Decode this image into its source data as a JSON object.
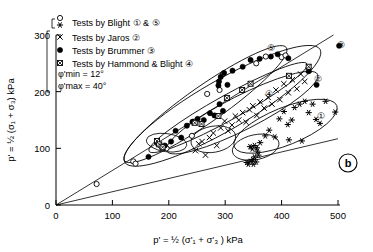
{
  "panel_label": "b",
  "axes": {
    "x": {
      "label": "p' = ½ (σ'₁ + σ'₃ ) kPa",
      "ticks": [
        "0",
        "100",
        "200",
        "300",
        "400",
        "500"
      ],
      "range": [
        0,
        500
      ]
    },
    "y": {
      "label": "p' = ½ (σ₁ + σ₃) kPa",
      "ticks": [
        "0",
        "100",
        "200",
        "300"
      ],
      "range": [
        0,
        300
      ]
    }
  },
  "legend": {
    "items": [
      {
        "marker": "circle-open-and-asterisk",
        "label": "Tests by Blight",
        "groups": "① & ⑤"
      },
      {
        "marker": "cross-x",
        "label": "Tests by Jaros",
        "groups": "②"
      },
      {
        "marker": "circle-filled",
        "label": "Tests by Brummer",
        "groups": "③"
      },
      {
        "marker": "square-hatched",
        "label": "Tests by Hammond & Blight",
        "groups": "④"
      }
    ]
  },
  "annotations": {
    "phi_min": "φ'min = 12°",
    "phi_max": "φ'max = 40°"
  },
  "group_labels": [
    {
      "text": "①",
      "x": 470,
      "y": 157
    },
    {
      "text": "②",
      "x": 465,
      "y": 222
    },
    {
      "text": "③",
      "x": 505,
      "y": 283
    },
    {
      "text": "④",
      "x": 378,
      "y": 196
    },
    {
      "text": "⑤",
      "x": 382,
      "y": 277
    }
  ],
  "chart_data": {
    "type": "scatter",
    "title": "",
    "xlabel": "p' = ½ (σ'₁ + σ'₃ ) kPa",
    "ylabel": "p' = ½ (σ₁ + σ₃) kPa",
    "xlim": [
      0,
      500
    ],
    "ylim": [
      0,
      300
    ],
    "grid": false,
    "legend_position": "top-left",
    "series": [
      {
        "name": "Tests by Blight (open circle)",
        "marker": "circle-open",
        "group": "⑤",
        "points": [
          [
            72,
            37
          ],
          [
            137,
            77
          ],
          [
            141,
            73
          ],
          [
            179,
            110
          ],
          [
            186,
            104
          ],
          [
            190,
            101
          ],
          [
            196,
            100
          ],
          [
            241,
            122
          ],
          [
            245,
            147
          ],
          [
            268,
            196
          ],
          [
            290,
            203
          ],
          [
            296,
            231
          ],
          [
            355,
            250
          ],
          [
            372,
            262
          ],
          [
            400,
            261
          ],
          [
            407,
            264
          ]
        ]
      },
      {
        "name": "Tests by Blight (asterisk)",
        "marker": "asterisk",
        "group": "①",
        "points": [
          [
            338,
            75
          ],
          [
            341,
            72
          ],
          [
            345,
            77
          ],
          [
            349,
            80
          ],
          [
            350,
            72
          ],
          [
            352,
            85
          ],
          [
            355,
            76
          ],
          [
            357,
            95
          ],
          [
            359,
            88
          ],
          [
            344,
            103
          ],
          [
            348,
            99
          ],
          [
            352,
            105
          ],
          [
            356,
            101
          ],
          [
            362,
            110
          ],
          [
            371,
            122
          ],
          [
            378,
            132
          ],
          [
            388,
            120
          ],
          [
            396,
            152
          ],
          [
            404,
            165
          ],
          [
            411,
            142
          ],
          [
            418,
            150
          ],
          [
            423,
            172
          ],
          [
            432,
            178
          ],
          [
            441,
            183
          ],
          [
            448,
            163
          ],
          [
            455,
            178
          ],
          [
            461,
            151
          ],
          [
            468,
            144
          ],
          [
            478,
            183
          ],
          [
            495,
            164
          ],
          [
            413,
            115
          ],
          [
            436,
            113
          ]
        ]
      },
      {
        "name": "Tests by Jaros",
        "marker": "cross-x",
        "group": "②",
        "points": [
          [
            247,
            96
          ],
          [
            253,
            108
          ],
          [
            259,
            112
          ],
          [
            265,
            88
          ],
          [
            272,
            119
          ],
          [
            279,
            127
          ],
          [
            285,
            105
          ],
          [
            292,
            136
          ],
          [
            299,
            148
          ],
          [
            305,
            131
          ],
          [
            312,
            141
          ],
          [
            318,
            157
          ],
          [
            324,
            150
          ],
          [
            331,
            163
          ],
          [
            337,
            146
          ],
          [
            343,
            168
          ],
          [
            349,
            175
          ],
          [
            356,
            158
          ],
          [
            362,
            182
          ],
          [
            369,
            171
          ],
          [
            376,
            190
          ],
          [
            383,
            178
          ],
          [
            390,
            203
          ],
          [
            397,
            186
          ],
          [
            404,
            214
          ],
          [
            412,
            198
          ],
          [
            419,
            221
          ],
          [
            427,
            205
          ],
          [
            434,
            231
          ],
          [
            441,
            218
          ],
          [
            448,
            238
          ]
        ]
      },
      {
        "name": "Tests by Brummer",
        "marker": "circle-filled",
        "group": "③",
        "points": [
          [
            164,
            85
          ],
          [
            181,
            108
          ],
          [
            193,
            105
          ],
          [
            204,
            112
          ],
          [
            212,
            131
          ],
          [
            222,
            119
          ],
          [
            232,
            140
          ],
          [
            242,
            147
          ],
          [
            251,
            152
          ],
          [
            262,
            150
          ],
          [
            273,
            162
          ],
          [
            281,
            158
          ],
          [
            290,
            178
          ],
          [
            296,
            166
          ],
          [
            288,
            211
          ],
          [
            289,
            218
          ],
          [
            292,
            226
          ],
          [
            298,
            233
          ],
          [
            304,
            212
          ],
          [
            313,
            237
          ],
          [
            331,
            244
          ],
          [
            345,
            256
          ],
          [
            361,
            258
          ],
          [
            381,
            262
          ],
          [
            393,
            266
          ],
          [
            412,
            259
          ],
          [
            448,
            236
          ],
          [
            462,
            212
          ],
          [
            502,
            281
          ]
        ]
      },
      {
        "name": "Tests by Hammond & Blight",
        "marker": "square-hatched",
        "group": "④",
        "points": [
          [
            179,
            113
          ],
          [
            183,
            107
          ],
          [
            189,
            102
          ],
          [
            246,
            145
          ],
          [
            258,
            143
          ],
          [
            288,
            157
          ],
          [
            303,
            189
          ],
          [
            330,
            203
          ],
          [
            345,
            214
          ],
          [
            413,
            228
          ],
          [
            448,
            244
          ]
        ]
      }
    ],
    "envelope_lines": [
      {
        "name": "phi-max-40",
        "from": [
          0,
          0
        ],
        "to": [
          492,
          300
        ],
        "label": "φ'max = 40°"
      },
      {
        "name": "phi-min-12",
        "from": [
          0,
          0
        ],
        "to": [
          500,
          117
        ],
        "label": "φ'min = 12°"
      }
    ],
    "group_ellipses": [
      {
        "name": "①",
        "cx": 407,
        "cy": 139,
        "rx": 98,
        "ry": 33,
        "rot": -22
      },
      {
        "name": "②",
        "cx": 330,
        "cy": 163,
        "rx": 150,
        "ry": 30,
        "rot": -27
      },
      {
        "name": "③",
        "cx": 295,
        "cy": 175,
        "rx": 200,
        "ry": 44,
        "rot": -30
      },
      {
        "name": "④",
        "cx": 305,
        "cy": 172,
        "rx": 160,
        "ry": 22,
        "rot": -29
      },
      {
        "name": "⑤",
        "cx": 265,
        "cy": 178,
        "rx": 175,
        "ry": 32,
        "rot": -35
      },
      {
        "name": "jaros-sub",
        "cx": 279,
        "cy": 116,
        "rx": 40,
        "ry": 23,
        "rot": -10
      },
      {
        "name": "blight-sub",
        "cx": 354,
        "cy": 102,
        "rx": 42,
        "ry": 22,
        "rot": -12
      },
      {
        "name": "low-sub",
        "cx": 196,
        "cy": 110,
        "rx": 36,
        "ry": 16,
        "rot": 8
      }
    ]
  }
}
